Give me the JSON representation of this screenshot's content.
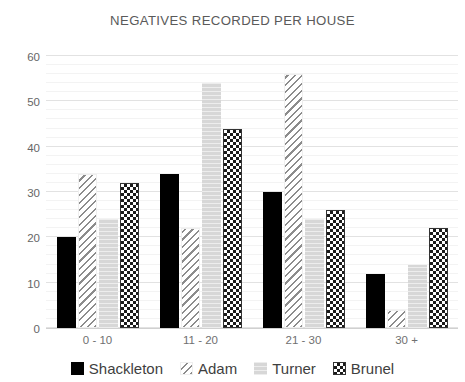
{
  "chart_data": {
    "type": "bar",
    "title": "NEGATIVES RECORDED PER HOUSE",
    "xlabel": "",
    "ylabel": "",
    "categories": [
      "0 - 10",
      "11 - 20",
      "21 - 30",
      "30 +"
    ],
    "series": [
      {
        "name": "Shackleton",
        "values": [
          20,
          34,
          30,
          12
        ],
        "pattern": "solid-black",
        "color": "#000000"
      },
      {
        "name": "Adam",
        "values": [
          34,
          22,
          56,
          4
        ],
        "pattern": "diagonal-hatch",
        "color": "#8c8c8c"
      },
      {
        "name": "Turner",
        "values": [
          24,
          54,
          24,
          14
        ],
        "pattern": "light-gray-fill",
        "color": "#d7d7d7"
      },
      {
        "name": "Brunel",
        "values": [
          32,
          44,
          26,
          22
        ],
        "pattern": "checkerboard",
        "color": "#1a1a1a"
      }
    ],
    "ylim": [
      0,
      60
    ],
    "ytick_labels": [
      "0",
      "10",
      "20",
      "30",
      "40",
      "50",
      "60"
    ],
    "ytick_values": [
      0,
      10,
      20,
      30,
      40,
      50,
      60
    ],
    "minor_tick_step": 2,
    "grid": true,
    "legend_position": "bottom"
  },
  "legend": {
    "items": [
      {
        "label": "Shackleton",
        "swatch": "solid-black-swatch"
      },
      {
        "label": "Adam",
        "swatch": "diagonal-hatch-swatch"
      },
      {
        "label": "Turner",
        "swatch": "light-gray-swatch"
      },
      {
        "label": "Brunel",
        "swatch": "checkerboard-swatch"
      }
    ]
  },
  "colors": {
    "title": "#5a5a5a",
    "tick_label": "#6b6b6b",
    "gridline_major": "#e2e2e2",
    "gridline_minor": "#f3f3f3",
    "axis": "#d0d0d0",
    "background": "#ffffff"
  }
}
